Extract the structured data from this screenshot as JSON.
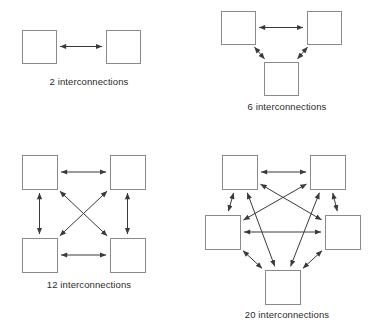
{
  "figure": {
    "background_color": "#ffffff",
    "box_stroke_color": "#8a8a8a",
    "edge_stroke_color": "#3a3a3a",
    "caption_color": "#2b2b2b"
  },
  "panels": [
    {
      "id": "panel-2",
      "caption": "2 interconnections",
      "node_count": 2,
      "interconnections": 2,
      "nodes": [
        {
          "name": "node-left",
          "x": 22,
          "y": 30,
          "w": 34,
          "h": 33
        },
        {
          "name": "node-right",
          "x": 106,
          "y": 30,
          "w": 34,
          "h": 33
        }
      ],
      "edges": [
        {
          "from": "node-left",
          "to": "node-right",
          "bidirectional": true
        }
      ]
    },
    {
      "id": "panel-6",
      "caption": "6 interconnections",
      "node_count": 3,
      "interconnections": 6,
      "nodes": [
        {
          "name": "node-top-left",
          "x": 221,
          "y": 11,
          "w": 34,
          "h": 33
        },
        {
          "name": "node-top-right",
          "x": 307,
          "y": 11,
          "w": 34,
          "h": 33
        },
        {
          "name": "node-bottom",
          "x": 264,
          "y": 62,
          "w": 34,
          "h": 33
        }
      ],
      "edges": [
        {
          "from": "node-top-left",
          "to": "node-top-right",
          "bidirectional": true
        },
        {
          "from": "node-top-left",
          "to": "node-bottom",
          "bidirectional": true
        },
        {
          "from": "node-top-right",
          "to": "node-bottom",
          "bidirectional": true
        }
      ]
    },
    {
      "id": "panel-12",
      "caption": "12 interconnections",
      "node_count": 4,
      "interconnections": 12,
      "nodes": [
        {
          "name": "node-top-left",
          "x": 22,
          "y": 155,
          "w": 35,
          "h": 34
        },
        {
          "name": "node-top-right",
          "x": 110,
          "y": 155,
          "w": 35,
          "h": 34
        },
        {
          "name": "node-bottom-left",
          "x": 22,
          "y": 238,
          "w": 35,
          "h": 34
        },
        {
          "name": "node-bottom-right",
          "x": 110,
          "y": 238,
          "w": 35,
          "h": 34
        }
      ],
      "edges": [
        {
          "from": "node-top-left",
          "to": "node-top-right",
          "bidirectional": true
        },
        {
          "from": "node-bottom-left",
          "to": "node-bottom-right",
          "bidirectional": true
        },
        {
          "from": "node-top-left",
          "to": "node-bottom-left",
          "bidirectional": true
        },
        {
          "from": "node-top-right",
          "to": "node-bottom-right",
          "bidirectional": true
        },
        {
          "from": "node-top-left",
          "to": "node-bottom-right",
          "bidirectional": true
        },
        {
          "from": "node-top-right",
          "to": "node-bottom-left",
          "bidirectional": true
        }
      ]
    },
    {
      "id": "panel-20",
      "caption": "20 interconnections",
      "node_count": 5,
      "interconnections": 20,
      "nodes": [
        {
          "name": "node-top-left",
          "x": 222,
          "y": 155,
          "w": 35,
          "h": 34
        },
        {
          "name": "node-top-right",
          "x": 310,
          "y": 155,
          "w": 35,
          "h": 34
        },
        {
          "name": "node-mid-left",
          "x": 205,
          "y": 215,
          "w": 35,
          "h": 34
        },
        {
          "name": "node-mid-right",
          "x": 325,
          "y": 215,
          "w": 35,
          "h": 34
        },
        {
          "name": "node-bottom",
          "x": 265,
          "y": 270,
          "w": 35,
          "h": 34
        }
      ],
      "edges": [
        {
          "from": "node-top-left",
          "to": "node-top-right",
          "bidirectional": true
        },
        {
          "from": "node-top-left",
          "to": "node-mid-left",
          "bidirectional": true
        },
        {
          "from": "node-top-right",
          "to": "node-mid-right",
          "bidirectional": true
        },
        {
          "from": "node-mid-left",
          "to": "node-bottom",
          "bidirectional": true
        },
        {
          "from": "node-mid-right",
          "to": "node-bottom",
          "bidirectional": true
        },
        {
          "from": "node-mid-left",
          "to": "node-mid-right",
          "bidirectional": true
        },
        {
          "from": "node-top-left",
          "to": "node-mid-right",
          "bidirectional": true
        },
        {
          "from": "node-top-left",
          "to": "node-bottom",
          "bidirectional": true
        },
        {
          "from": "node-top-right",
          "to": "node-mid-left",
          "bidirectional": true
        },
        {
          "from": "node-top-right",
          "to": "node-bottom",
          "bidirectional": true
        }
      ]
    }
  ]
}
